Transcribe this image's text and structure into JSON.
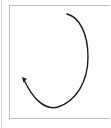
{
  "figure": {
    "title": "Curved arrow diagram",
    "description": "An open counter-clockwise C-shaped curved arrow inside a thin rectangular frame",
    "background_color": "#ffffff"
  },
  "frame": {
    "name": "panel-border",
    "stroke_color": "#bdbdbd",
    "stroke_width": 1,
    "x": 9,
    "y": 5,
    "width": 101,
    "height": 114
  },
  "left_rule": {
    "name": "page-edge-rule",
    "stroke_color": "#d2d2d2",
    "stroke_width": 1,
    "x": 1,
    "y": 0,
    "height": 128
  },
  "arrow": {
    "name": "curved-arrow",
    "stroke_color": "#1a1a1a",
    "stroke_width": 1.4,
    "direction": "counter-clockwise",
    "open_gap_side": "left",
    "start_point": [
      67,
      14
    ],
    "end_point": [
      23,
      79
    ],
    "rightmost_x": 88,
    "bottom_y": 108,
    "path": "M 67 14 C 79 17, 88 33, 88 57 C 88 82, 76 101, 58 107 C 44 111, 32 97, 24 80",
    "arrowhead": {
      "name": "arrowhead",
      "tip": [
        22,
        77
      ],
      "size": 5,
      "fill_color": "#1a1a1a",
      "points_toward": "up-left"
    }
  }
}
